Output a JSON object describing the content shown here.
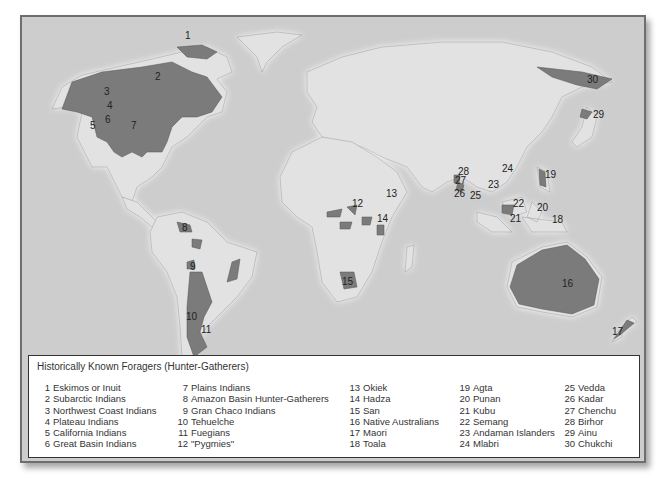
{
  "map": {
    "title": "Historically Known Foragers (Hunter-Gatherers)",
    "colors": {
      "ocean": "#cfcfcf",
      "land": "#e4e4e4",
      "forager_region": "#7a7a7a",
      "coast_glow": "#f2f2f2"
    },
    "labels": [
      {
        "id": "1",
        "region": "Arctic North America"
      },
      {
        "id": "2",
        "region": "Canada"
      },
      {
        "id": "3",
        "region": "Pacific Northwest"
      },
      {
        "id": "4",
        "region": "Plateau"
      },
      {
        "id": "5",
        "region": "California"
      },
      {
        "id": "6",
        "region": "Great Basin"
      },
      {
        "id": "7",
        "region": "Great Plains"
      },
      {
        "id": "8",
        "region": "Amazon Basin"
      },
      {
        "id": "9",
        "region": "Gran Chaco"
      },
      {
        "id": "10",
        "region": "Patagonia"
      },
      {
        "id": "11",
        "region": "Tierra del Fuego"
      },
      {
        "id": "12",
        "region": "Central Africa"
      },
      {
        "id": "13",
        "region": "East Africa"
      },
      {
        "id": "14",
        "region": "Tanzania"
      },
      {
        "id": "15",
        "region": "Kalahari"
      },
      {
        "id": "16",
        "region": "Australia"
      },
      {
        "id": "17",
        "region": "New Zealand"
      },
      {
        "id": "18",
        "region": "Sulawesi"
      },
      {
        "id": "19",
        "region": "Philippines"
      },
      {
        "id": "20",
        "region": "Borneo"
      },
      {
        "id": "21",
        "region": "Sumatra"
      },
      {
        "id": "22",
        "region": "Malay Peninsula"
      },
      {
        "id": "23",
        "region": "Andaman Islands"
      },
      {
        "id": "24",
        "region": "Thailand/Laos"
      },
      {
        "id": "25",
        "region": "Sri Lanka"
      },
      {
        "id": "26",
        "region": "South India"
      },
      {
        "id": "27",
        "region": "Central India"
      },
      {
        "id": "28",
        "region": "East India"
      },
      {
        "id": "29",
        "region": "Hokkaido"
      },
      {
        "id": "30",
        "region": "Chukotka"
      }
    ]
  },
  "legend": {
    "title": "Historically Known Foragers (Hunter-Gatherers)",
    "columns": [
      [
        {
          "num": "1",
          "name": "Eskimos or Inuit"
        },
        {
          "num": "2",
          "name": "Subarctic Indians"
        },
        {
          "num": "3",
          "name": "Northwest Coast Indians"
        },
        {
          "num": "4",
          "name": "Plateau Indians"
        },
        {
          "num": "5",
          "name": "California Indians"
        },
        {
          "num": "6",
          "name": "Great Basin Indians"
        }
      ],
      [
        {
          "num": "7",
          "name": "Plains Indians"
        },
        {
          "num": "8",
          "name": "Amazon Basin Hunter-Gatherers"
        },
        {
          "num": "9",
          "name": "Gran Chaco Indians"
        },
        {
          "num": "10",
          "name": "Tehuelche"
        },
        {
          "num": "11",
          "name": "Fuegians"
        },
        {
          "num": "12",
          "name": "\"Pygmies\""
        }
      ],
      [
        {
          "num": "13",
          "name": "Okiek"
        },
        {
          "num": "14",
          "name": "Hadza"
        },
        {
          "num": "15",
          "name": "San"
        },
        {
          "num": "16",
          "name": "Native Australians"
        },
        {
          "num": "17",
          "name": "Maori"
        },
        {
          "num": "18",
          "name": "Toala"
        }
      ],
      [
        {
          "num": "19",
          "name": "Agta"
        },
        {
          "num": "20",
          "name": "Punan"
        },
        {
          "num": "21",
          "name": "Kubu"
        },
        {
          "num": "22",
          "name": "Semang"
        },
        {
          "num": "23",
          "name": "Andaman Islanders"
        },
        {
          "num": "24",
          "name": "Mlabri"
        }
      ],
      [
        {
          "num": "25",
          "name": "Vedda"
        },
        {
          "num": "26",
          "name": "Kadar"
        },
        {
          "num": "27",
          "name": "Chenchu"
        },
        {
          "num": "28",
          "name": "Birhor"
        },
        {
          "num": "29",
          "name": "Ainu"
        },
        {
          "num": "30",
          "name": "Chukchi"
        }
      ]
    ]
  }
}
